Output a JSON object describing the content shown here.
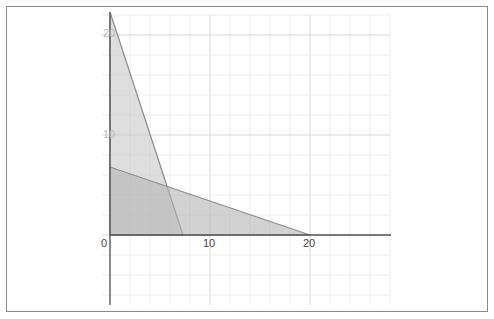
{
  "chart_data": {
    "type": "area",
    "title": "",
    "xlabel": "",
    "ylabel": "",
    "xlim": [
      0,
      28
    ],
    "ylim": [
      -7,
      22
    ],
    "grid": true,
    "grid_step": 2,
    "x_tick_labels": [
      "0",
      "10",
      "20"
    ],
    "y_tick_labels": [
      "10",
      "20"
    ],
    "series": [
      {
        "name": "constraint-1 region",
        "polygon": [
          [
            0,
            0
          ],
          [
            0,
            22.3
          ],
          [
            7.3,
            0
          ]
        ],
        "fill": "#c8c8c8"
      },
      {
        "name": "constraint-2 region",
        "polygon": [
          [
            0,
            0
          ],
          [
            0,
            6.8
          ],
          [
            20,
            0
          ]
        ],
        "fill": "#b4b4b4"
      }
    ],
    "legend": []
  },
  "axes": {
    "origin_label": "0",
    "x_label_10": "10",
    "x_label_20": "20",
    "y_label_10": "10",
    "y_label_20": "20"
  }
}
